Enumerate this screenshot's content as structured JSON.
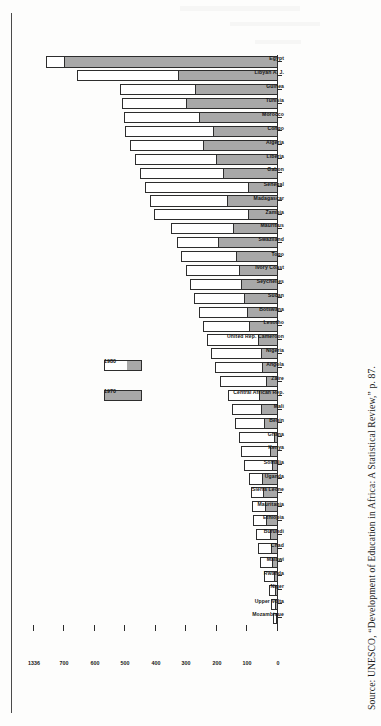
{
  "figure": {
    "orientation": "rotated-90-ccw",
    "source_caption": "Source: UNESCO, “Development of Education in Africa: A Statistical Review,” p. 87."
  },
  "legend": {
    "position": "upper-left-of-plot",
    "items": [
      {
        "label": "1970",
        "swatch": "solid-gray",
        "color": "#a8a8a8"
      },
      {
        "label": "1980",
        "swatch": "white-over-gray",
        "color": "#ffffff"
      }
    ]
  },
  "axis": {
    "value_ticks": [
      "0",
      "100",
      "200",
      "300",
      "400",
      "500",
      "600",
      "700",
      "1336"
    ],
    "has_break": true,
    "break_note": "axis break between 700 and 1336"
  },
  "colors": {
    "series_1970": "#a8a8a8",
    "series_1980": "#ffffff",
    "outline": "#2d2d2d",
    "text": "#151515"
  },
  "chart_data": {
    "type": "bar",
    "title": "",
    "subtitle": "",
    "xlabel": "",
    "ylabel": "",
    "grid": false,
    "legend_position": "upper-left",
    "ylim": [
      0,
      760
    ],
    "yticks": [
      0,
      100,
      200,
      300,
      400,
      500,
      600,
      700,
      1336
    ],
    "axis_break": {
      "from": 700,
      "to": 1336
    },
    "categories": [
      "Mozambique",
      "Upper Volta",
      "Niger",
      "Rwanda",
      "Malawi",
      "Chad",
      "Burundi",
      "Ethiopia",
      "Mauritania",
      "Sierra Leone",
      "Uganda",
      "Somalia",
      "Kenya",
      "Ghana",
      "Benin",
      "Mali",
      "Central African Rep.",
      "Zaire",
      "Angola",
      "Nigeria",
      "United Rep. Cameroon",
      "Lesotho",
      "Botswana",
      "Sudan",
      "Seychelles",
      "Ivory Coast",
      "Togo",
      "Swaziland",
      "Mauritius",
      "Zambia",
      "Madagascar",
      "Senegal",
      "Gabon",
      "Liberia",
      "Algeria",
      "Congo",
      "Morocco",
      "Tunisia",
      "Guinea",
      "Libyan A. J.",
      "Egypt"
    ],
    "series": [
      {
        "name": "1970",
        "values": [
          8,
          11,
          9,
          14,
          20,
          22,
          27,
          39,
          41,
          48,
          52,
          19,
          26,
          14,
          46,
          55,
          62,
          39,
          52,
          57,
          66,
          95,
          102,
          110,
          120,
          128,
          137,
          196,
          147,
          97,
          168,
          99,
          179,
          202,
          246,
          213,
          258,
          302,
          272,
          327,
          700
        ]
      },
      {
        "name": "1980",
        "values": [
          18,
          24,
          31,
          46,
          60,
          66,
          72,
          82,
          84,
          90,
          96,
          112,
          122,
          128,
          140,
          152,
          165,
          190,
          205,
          218,
          232,
          246,
          260,
          274,
          288,
          300,
          318,
          330,
          352,
          406,
          420,
          436,
          452,
          468,
          486,
          500,
          505,
          512,
          518,
          660,
          1336
        ]
      }
    ]
  }
}
